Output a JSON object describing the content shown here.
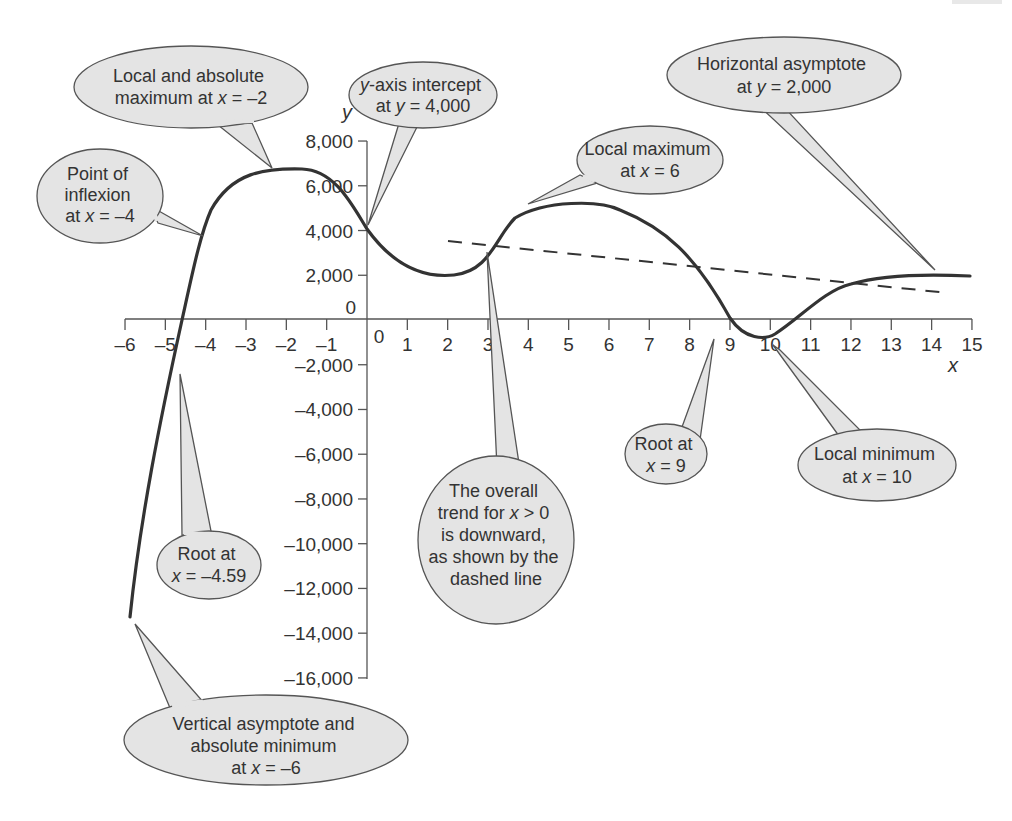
{
  "chart_data": {
    "type": "line",
    "title": "",
    "xlabel": "x",
    "ylabel": "y",
    "xlim": [
      -6,
      15
    ],
    "ylim": [
      -16000,
      8000
    ],
    "grid": false,
    "x_ticks": [
      "-6",
      "-5",
      "-4",
      "-3",
      "-2",
      "-1",
      "0",
      "1",
      "2",
      "3",
      "4",
      "5",
      "6",
      "7",
      "8",
      "9",
      "10",
      "11",
      "12",
      "13",
      "14",
      "15"
    ],
    "x_tick_labels": [
      "–6",
      "–5",
      "–4",
      "–3",
      "–2",
      "–1",
      "0",
      "1",
      "2",
      "3",
      "4",
      "5",
      "6",
      "7",
      "8",
      "9",
      "10",
      "11",
      "12",
      "13",
      "14",
      "15"
    ],
    "y_ticks": [
      8000,
      6000,
      4000,
      2000,
      0,
      -2000,
      -4000,
      -6000,
      -8000,
      -10000,
      -12000,
      -14000,
      -16000
    ],
    "y_tick_labels": [
      "8,000",
      "6,000",
      "4,000",
      "2,000",
      "0",
      "–2,000",
      "–4,000",
      "–6,000",
      "–8,000",
      "–10,000",
      "–12,000",
      "–14,000",
      "–16,000"
    ],
    "series": [
      {
        "name": "f(x)",
        "style": "solid",
        "x": [
          -6,
          -5.5,
          -5,
          -4.59,
          -4,
          -3,
          -2,
          -1.6,
          -1,
          0,
          1,
          2.2,
          3,
          4,
          5,
          6,
          7,
          8,
          9,
          10,
          11,
          12,
          13,
          14,
          15
        ],
        "y": [
          -13300,
          -8000,
          -3200,
          0,
          4500,
          6000,
          6550,
          6600,
          6200,
          4000,
          2600,
          2000,
          2400,
          4300,
          4950,
          5000,
          4500,
          2600,
          0,
          -700,
          200,
          1600,
          1950,
          2000,
          2000
        ]
      },
      {
        "name": "trend (x > 0)",
        "style": "dashed",
        "x": [
          2,
          14.4
        ],
        "y": [
          3500,
          1200
        ]
      }
    ],
    "annotations": [
      {
        "id": "abs-max",
        "lines": [
          "Local and absolute",
          "maximum at x = –2"
        ],
        "points_to": [
          -2,
          6600
        ]
      },
      {
        "id": "inflexion",
        "lines": [
          "Point of",
          "inflexion",
          "at x = –4"
        ],
        "points_to": [
          -4,
          4500
        ]
      },
      {
        "id": "y-intercept",
        "lines": [
          "y-axis intercept",
          "at y = 4,000"
        ],
        "points_to": [
          0,
          4000
        ]
      },
      {
        "id": "local-max",
        "lines": [
          "Local maximum",
          "at x = 6"
        ],
        "points_to": [
          4.5,
          4900
        ]
      },
      {
        "id": "horiz-asymptote",
        "lines": [
          "Horizontal asymptote",
          "at y = 2,000"
        ],
        "points_to": [
          14.2,
          2000
        ]
      },
      {
        "id": "root-neg",
        "lines": [
          "Root at",
          "x = –4.59"
        ],
        "points_to": [
          -4.59,
          0
        ]
      },
      {
        "id": "trend",
        "lines": [
          "The overall",
          "trend for x > 0",
          "is downward,",
          "as shown by the",
          "dashed line"
        ],
        "points_to": [
          4.6,
          2900
        ]
      },
      {
        "id": "root-9",
        "lines": [
          "Root at",
          "x = 9"
        ],
        "points_to": [
          8.6,
          0
        ]
      },
      {
        "id": "local-min",
        "lines": [
          "Local minimum",
          "at x = 10"
        ],
        "points_to": [
          10.1,
          -700
        ]
      },
      {
        "id": "vert-asymptote",
        "lines": [
          "Vertical asymptote and",
          "absolute minimum",
          "at x = –6"
        ],
        "points_to": [
          -6,
          -13300
        ]
      }
    ]
  },
  "labels": {
    "y_axis_title": "y",
    "x_axis_title": "x",
    "origin_label": "0",
    "callouts": {
      "abs_max": [
        "Local and absolute",
        "maximum at ",
        "x",
        " = –2"
      ],
      "inflexion": [
        "Point of",
        "inflexion",
        "at ",
        "x",
        " = –4"
      ],
      "y_intercept": [
        "y",
        "-axis intercept",
        "at ",
        "y",
        " = 4,000"
      ],
      "local_max": [
        "Local maximum",
        "at ",
        "x",
        " = 6"
      ],
      "horiz_asymptote": [
        "Horizontal asymptote",
        "at ",
        "y",
        " = 2,000"
      ],
      "root_neg": [
        "Root at",
        "x",
        " = –4.59"
      ],
      "trend": [
        "The overall",
        "trend for ",
        "x",
        " > 0",
        "is downward,",
        "as shown by the",
        "dashed line"
      ],
      "root_9": [
        "Root at",
        "x",
        " = 9"
      ],
      "local_min": [
        "Local minimum",
        "at ",
        "x",
        " = 10"
      ],
      "vert_asymptote": [
        "Vertical asymptote and",
        "absolute minimum",
        "at ",
        "x",
        " = –6"
      ]
    }
  },
  "colors": {
    "curve": "#333333",
    "axis": "#555555",
    "callout_fill": "#e4e4e4",
    "callout_stroke": "#555555",
    "text": "#333333"
  }
}
